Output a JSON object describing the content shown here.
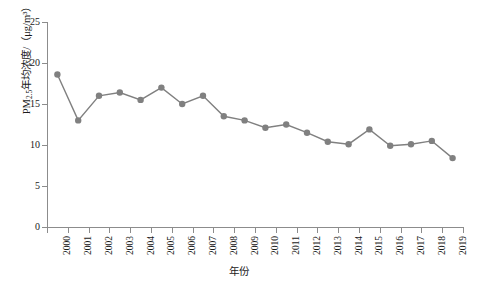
{
  "chart_data": {
    "type": "line",
    "title": "",
    "xlabel": "年份",
    "ylabel": "PM2.5年均浓度/（μg/m³）",
    "ylabel_prefix": "PM",
    "ylabel_sub": "2.5",
    "ylabel_suffix": "年均浓度/（μg/m³）",
    "categories": [
      "2000",
      "2001",
      "2002",
      "2003",
      "2004",
      "2005",
      "2006",
      "2007",
      "2008",
      "2009",
      "2010",
      "2011",
      "2012",
      "2013",
      "2014",
      "2015",
      "2016",
      "2017",
      "2018",
      "2019"
    ],
    "values": [
      18.6,
      13.0,
      16.0,
      16.4,
      15.5,
      17.0,
      15.0,
      16.0,
      13.5,
      13.0,
      12.1,
      12.5,
      11.5,
      10.4,
      10.1,
      11.9,
      9.9,
      10.1,
      10.5,
      8.4
    ],
    "ylim": [
      0,
      25
    ],
    "yticks": [
      0,
      5,
      10,
      15,
      20,
      25
    ],
    "ytick_labels": [
      "0",
      "5",
      "10",
      "15",
      "20",
      "25"
    ],
    "grid": false,
    "legend": "none",
    "series_color": "#808080",
    "marker": "circle",
    "marker_color": "#808080",
    "axis_color": "#8c8c8c",
    "background": "#ffffff"
  }
}
